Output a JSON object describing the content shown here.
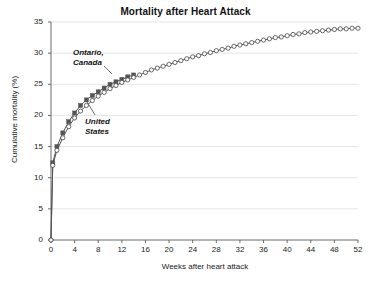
{
  "chart_data": {
    "type": "line",
    "title": "Mortality after Heart Attack",
    "xlabel": "Weeks after heart attack",
    "ylabel": "Cumulative mortality (%)",
    "xlim": [
      0,
      52
    ],
    "ylim": [
      0,
      35
    ],
    "xticks": [
      0,
      4,
      8,
      12,
      16,
      20,
      24,
      28,
      32,
      36,
      40,
      44,
      48,
      52
    ],
    "yticks": [
      0,
      5,
      10,
      15,
      20,
      25,
      30,
      35
    ],
    "grid": "horizontal",
    "legend": "inline-annotations",
    "annotations": [
      {
        "text": "Ontario,\nCanada",
        "line1": "Ontario,",
        "line2": "Canada",
        "points_to_series": "Ontario, Canada"
      },
      {
        "text": "United\nStates",
        "line1": "United",
        "line2": "States",
        "points_to_series": "United States"
      }
    ],
    "series": [
      {
        "name": "Ontario, Canada",
        "marker": "filled-square",
        "color": "#555555",
        "x": [
          0,
          0.3,
          1,
          2,
          3,
          4,
          5,
          6,
          7,
          8,
          9,
          10,
          11,
          12,
          13,
          14
        ],
        "values": [
          0,
          12.4,
          15.0,
          17.2,
          19.0,
          20.4,
          21.6,
          22.5,
          23.2,
          23.8,
          24.4,
          25.0,
          25.4,
          25.8,
          26.2,
          26.5
        ]
      },
      {
        "name": "United States",
        "marker": "open-circle",
        "color": "#555555",
        "x": [
          0,
          0.3,
          1,
          2,
          3,
          4,
          5,
          6,
          7,
          8,
          9,
          10,
          11,
          12,
          13,
          14,
          15,
          16,
          17,
          18,
          19,
          20,
          21,
          22,
          23,
          24,
          25,
          26,
          27,
          28,
          29,
          30,
          31,
          32,
          33,
          34,
          35,
          36,
          37,
          38,
          39,
          40,
          41,
          42,
          43,
          44,
          45,
          46,
          47,
          48,
          49,
          50,
          51,
          52
        ],
        "values": [
          0,
          12.0,
          14.4,
          16.4,
          18.2,
          19.6,
          20.7,
          21.6,
          22.4,
          23.1,
          23.7,
          24.3,
          24.8,
          25.3,
          25.7,
          26.1,
          26.5,
          26.9,
          27.3,
          27.6,
          27.9,
          28.2,
          28.5,
          28.8,
          29.1,
          29.4,
          29.6,
          29.9,
          30.1,
          30.4,
          30.6,
          30.8,
          31.1,
          31.3,
          31.5,
          31.7,
          31.9,
          32.1,
          32.3,
          32.5,
          32.6,
          32.8,
          33.0,
          33.1,
          33.3,
          33.4,
          33.5,
          33.6,
          33.7,
          33.8,
          33.9,
          33.9,
          34.0,
          34.0
        ]
      }
    ]
  }
}
